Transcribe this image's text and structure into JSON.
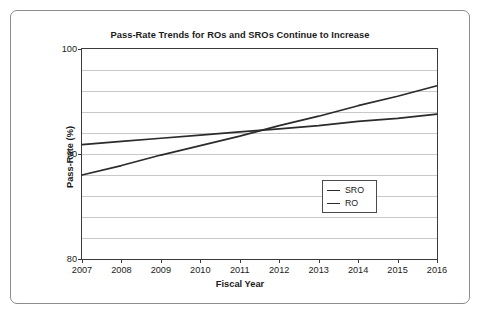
{
  "chart_data": {
    "type": "line",
    "title": "Pass-Rate Trends for ROs and SROs Continue to Increase",
    "xlabel": "Fiscal Year",
    "ylabel": "Pass-Rate (%)",
    "categories": [
      "2007",
      "2008",
      "2009",
      "2010",
      "2011",
      "2012",
      "2013",
      "2014",
      "2015",
      "2016"
    ],
    "x": [
      2007,
      2008,
      2009,
      2010,
      2011,
      2012,
      2013,
      2014,
      2015,
      2016
    ],
    "xlim": [
      2007,
      2016
    ],
    "ylim": [
      80,
      100
    ],
    "y_ticks": [
      "100",
      "90",
      "80"
    ],
    "y_tick_values": [
      100,
      90,
      80
    ],
    "gridlines": [
      98,
      96,
      94,
      92,
      90,
      88,
      86,
      84,
      82
    ],
    "grid": true,
    "legend_position": "inside-lower-right",
    "series": [
      {
        "name": "SRO",
        "color": "#2b2b2b",
        "values": [
          90.9,
          91.2,
          91.5,
          91.8,
          92.1,
          92.4,
          92.7,
          93.1,
          93.4,
          93.8
        ]
      },
      {
        "name": "RO",
        "color": "#2b2b2b",
        "values": [
          88.0,
          88.9,
          89.9,
          90.8,
          91.7,
          92.7,
          93.6,
          94.6,
          95.5,
          96.5
        ]
      }
    ]
  },
  "legend": {
    "entries": [
      {
        "label": "SRO"
      },
      {
        "label": "RO"
      }
    ]
  }
}
